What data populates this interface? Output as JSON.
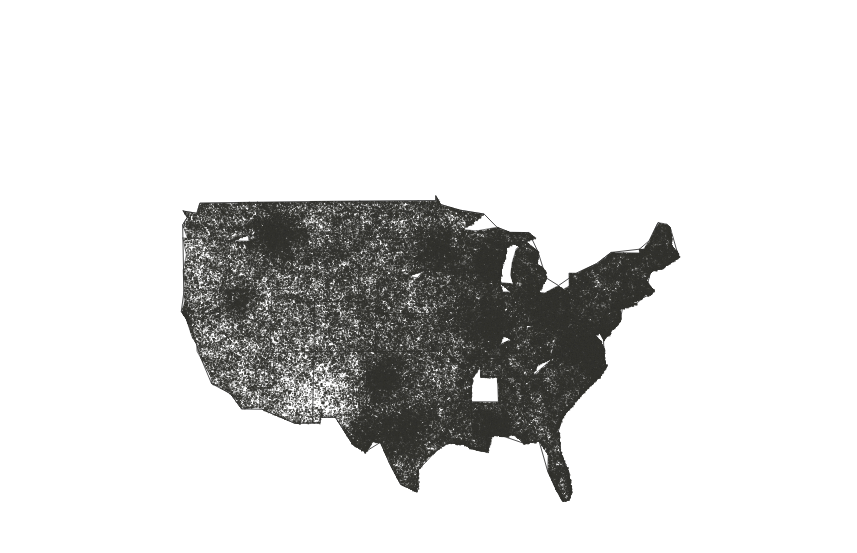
{
  "figure": {
    "kind": "dot-density-map",
    "title": "",
    "subtitle": "",
    "caption": "",
    "region": "Continental United States",
    "projection": "albers-equal-area-conic",
    "background_color": "#ffffff",
    "dot_color": "#33332f",
    "state_border_color": "#4a4a4a",
    "nation_border_color": "#3a3a3a",
    "width_px": 857,
    "height_px": 553,
    "legend": {
      "visible": false,
      "entries": []
    },
    "axes": {
      "visible": false
    },
    "labels": {
      "state_labels_visible": false,
      "city_labels_visible": false
    }
  },
  "chart_data": {
    "type": "scatter",
    "title": "",
    "subtitle": "",
    "xlabel": "",
    "ylabel": "",
    "grid": false,
    "legend_position": "none",
    "xlim": [
      -125,
      -66
    ],
    "ylim": [
      24,
      50
    ],
    "density_scale": {
      "unit": "relative dot density (0 = none, 10 = saturated)",
      "min": 0,
      "max": 10
    },
    "regions": [
      {
        "name": "Pacific Northwest Coast",
        "density": 6,
        "seed": 101
      },
      {
        "name": "Puget Sound",
        "density": 10,
        "seed": 102
      },
      {
        "name": "Willamette Valley",
        "density": 8,
        "seed": 103
      },
      {
        "name": "Central California",
        "density": 7,
        "seed": 104
      },
      {
        "name": "Southern California",
        "density": 9,
        "seed": 105
      },
      {
        "name": "Great Basin / Nevada",
        "density": 1,
        "seed": 106
      },
      {
        "name": "Wasatch Front",
        "density": 9,
        "seed": 107
      },
      {
        "name": "Idaho Mountains",
        "density": 7,
        "seed": 108
      },
      {
        "name": "Montana",
        "density": 3,
        "seed": 109
      },
      {
        "name": "Wyoming",
        "density": 2,
        "seed": 110
      },
      {
        "name": "Colorado Front Range",
        "density": 5,
        "seed": 111
      },
      {
        "name": "Arizona Desert",
        "density": 2,
        "seed": 112
      },
      {
        "name": "New Mexico",
        "density": 3,
        "seed": 113
      },
      {
        "name": "West Texas",
        "density": 1,
        "seed": 114
      },
      {
        "name": "East Texas",
        "density": 5,
        "seed": 115
      },
      {
        "name": "Gulf Coast Texas",
        "density": 6,
        "seed": 116
      },
      {
        "name": "Great Plains (Dakotas)",
        "density": 3,
        "seed": 117
      },
      {
        "name": "Nebraska / Kansas",
        "density": 4,
        "seed": 118
      },
      {
        "name": "Oklahoma",
        "density": 5,
        "seed": 119
      },
      {
        "name": "Minnesota",
        "density": 6,
        "seed": 120
      },
      {
        "name": "Iowa",
        "density": 6,
        "seed": 121
      },
      {
        "name": "Missouri",
        "density": 7,
        "seed": 122
      },
      {
        "name": "Wisconsin",
        "density": 7,
        "seed": 123
      },
      {
        "name": "Michigan",
        "density": 7,
        "seed": 124
      },
      {
        "name": "Illinois / Indiana",
        "density": 8,
        "seed": 125
      },
      {
        "name": "Ohio",
        "density": 8,
        "seed": 126
      },
      {
        "name": "Kentucky / Tennessee",
        "density": 9,
        "seed": 127
      },
      {
        "name": "Appalachia",
        "density": 9,
        "seed": 128
      },
      {
        "name": "Carolinas",
        "density": 9,
        "seed": 129
      },
      {
        "name": "Georgia / Alabama",
        "density": 10,
        "seed": 130
      },
      {
        "name": "Mississippi / Louisiana",
        "density": 8,
        "seed": 131
      },
      {
        "name": "Arkansas",
        "density": 8,
        "seed": 132
      },
      {
        "name": "Florida Peninsula",
        "density": 7,
        "seed": 133
      },
      {
        "name": "Mid-Atlantic",
        "density": 10,
        "seed": 134
      },
      {
        "name": "New York",
        "density": 8,
        "seed": 135
      },
      {
        "name": "New England",
        "density": 7,
        "seed": 136
      },
      {
        "name": "Maine",
        "density": 4,
        "seed": 137
      }
    ],
    "city_clusters": [
      {
        "name": "Seattle",
        "x": 108,
        "y": 48,
        "intensity": 10
      },
      {
        "name": "Portland",
        "x": 96,
        "y": 86,
        "intensity": 9
      },
      {
        "name": "Spokane",
        "x": 175,
        "y": 58,
        "intensity": 8
      },
      {
        "name": "Boise",
        "x": 183,
        "y": 128,
        "intensity": 8
      },
      {
        "name": "Salt Lake City",
        "x": 247,
        "y": 152,
        "intensity": 10
      },
      {
        "name": "Sacramento",
        "x": 74,
        "y": 205,
        "intensity": 8
      },
      {
        "name": "San Francisco",
        "x": 63,
        "y": 222,
        "intensity": 9
      },
      {
        "name": "Los Angeles",
        "x": 101,
        "y": 300,
        "intensity": 9
      },
      {
        "name": "San Diego",
        "x": 110,
        "y": 321,
        "intensity": 7
      },
      {
        "name": "Las Vegas",
        "x": 142,
        "y": 275,
        "intensity": 6
      },
      {
        "name": "Phoenix",
        "x": 177,
        "y": 318,
        "intensity": 6
      },
      {
        "name": "Denver",
        "x": 276,
        "y": 235,
        "intensity": 8
      },
      {
        "name": "Albuquerque",
        "x": 240,
        "y": 300,
        "intensity": 5
      },
      {
        "name": "Dallas",
        "x": 381,
        "y": 378,
        "intensity": 7
      },
      {
        "name": "Houston",
        "x": 405,
        "y": 430,
        "intensity": 7
      },
      {
        "name": "San Antonio",
        "x": 368,
        "y": 435,
        "intensity": 6
      },
      {
        "name": "Minneapolis",
        "x": 462,
        "y": 133,
        "intensity": 8
      },
      {
        "name": "Chicago",
        "x": 533,
        "y": 205,
        "intensity": 9
      },
      {
        "name": "Detroit",
        "x": 573,
        "y": 186,
        "intensity": 8
      },
      {
        "name": "St. Louis",
        "x": 492,
        "y": 262,
        "intensity": 8
      },
      {
        "name": "Kansas City",
        "x": 436,
        "y": 250,
        "intensity": 7
      },
      {
        "name": "Memphis",
        "x": 489,
        "y": 320,
        "intensity": 7
      },
      {
        "name": "Atlanta",
        "x": 586,
        "y": 345,
        "intensity": 9
      },
      {
        "name": "New Orleans",
        "x": 490,
        "y": 427,
        "intensity": 7
      },
      {
        "name": "Nashville",
        "x": 547,
        "y": 305,
        "intensity": 8
      },
      {
        "name": "Charlotte",
        "x": 634,
        "y": 311,
        "intensity": 8
      },
      {
        "name": "Miami",
        "x": 700,
        "y": 492,
        "intensity": 7
      },
      {
        "name": "Tampa",
        "x": 666,
        "y": 453,
        "intensity": 7
      },
      {
        "name": "Washington DC",
        "x": 686,
        "y": 263,
        "intensity": 10
      },
      {
        "name": "Philadelphia",
        "x": 706,
        "y": 238,
        "intensity": 10
      },
      {
        "name": "New York City",
        "x": 727,
        "y": 218,
        "intensity": 10
      },
      {
        "name": "Boston",
        "x": 767,
        "y": 182,
        "intensity": 9
      },
      {
        "name": "Pittsburgh",
        "x": 634,
        "y": 231,
        "intensity": 8
      },
      {
        "name": "Cleveland",
        "x": 606,
        "y": 207,
        "intensity": 8
      },
      {
        "name": "Richmond",
        "x": 680,
        "y": 283,
        "intensity": 7
      }
    ]
  },
  "map_geometry": {
    "state_boundaries_visible": true,
    "nation_boundary_visible": true,
    "state_count": 48
  }
}
